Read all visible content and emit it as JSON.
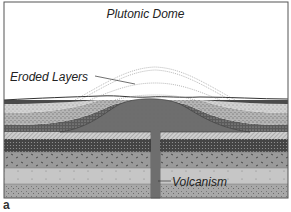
{
  "diagram": {
    "title": "Plutonic Dome",
    "labels": {
      "eroded_layers": "Eroded Layers",
      "volcanism": "Volcanism",
      "panel_letter": "a"
    },
    "colors": {
      "background": "#ffffff",
      "frame": "#555555",
      "dome_magma": "#6e6e6e",
      "top_band": "#4a4a4a",
      "light_stipple": "#d2d2d2",
      "medium_stipple": "#b4b4b4",
      "dark_speckled": "#5a5a5a",
      "hatched": "#c8c8c8",
      "dark_dense": "#444444",
      "grey_dashes": "#9a9a9a",
      "light_grey": "#c6c6c6",
      "bottom_stipple": "#a8a8a8",
      "eroded_outline": "#888888"
    },
    "layers_top_to_bottom": [
      "dark top band",
      "light stipple",
      "medium stipple",
      "dark speckled",
      "hatched light",
      "dark dense",
      "medium grey dashes",
      "light grey",
      "medium stipple"
    ]
  }
}
